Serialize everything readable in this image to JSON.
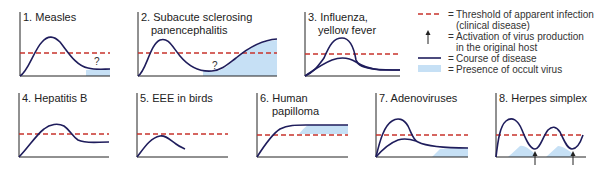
{
  "colors": {
    "threshold": "#c8332c",
    "course": "#1f1d5c",
    "occult": "#c6e0f5",
    "axis": "#222222"
  },
  "panels": [
    {
      "id": 1,
      "title_lines": [
        "1. Measles"
      ],
      "question_mark": "?"
    },
    {
      "id": 2,
      "title_lines": [
        "2. Subacute sclerosing",
        "panencephalitis"
      ],
      "question_mark": "?"
    },
    {
      "id": 3,
      "title_lines": [
        "3. Influenza,",
        "yellow fever"
      ]
    },
    {
      "id": 4,
      "title_lines": [
        "4. Hepatitis B"
      ]
    },
    {
      "id": 5,
      "title_lines": [
        "5. EEE in birds"
      ]
    },
    {
      "id": 6,
      "title_lines": [
        "6. Human",
        "papilloma"
      ]
    },
    {
      "id": 7,
      "title_lines": [
        "7. Adenoviruses"
      ]
    },
    {
      "id": 8,
      "title_lines": [
        "8. Herpes simplex"
      ]
    }
  ],
  "legend": {
    "items": [
      {
        "symbol": "dashed-red-line",
        "eq": "=",
        "lines": [
          "Threshold of apparent infection",
          "(clinical disease)"
        ]
      },
      {
        "symbol": "up-arrow",
        "eq": "=",
        "lines": [
          "Activation of virus production",
          "in the original host"
        ]
      },
      {
        "symbol": "solid-navy-line",
        "eq": "=",
        "lines": [
          "Course of disease"
        ]
      },
      {
        "symbol": "light-blue-box",
        "eq": "=",
        "lines": [
          "Presence of occult virus"
        ]
      }
    ]
  }
}
